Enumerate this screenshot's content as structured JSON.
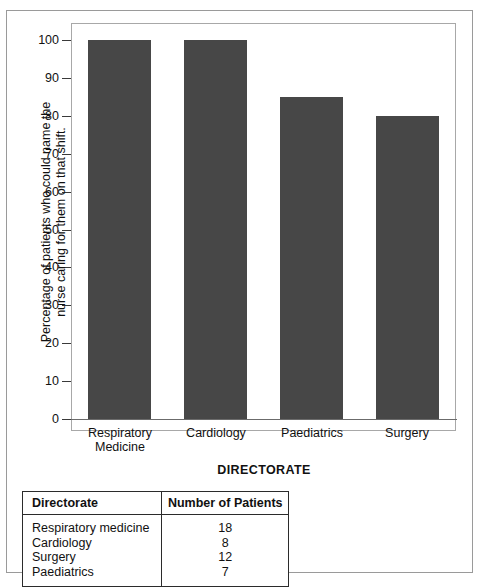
{
  "chart_data": {
    "type": "bar",
    "title": "",
    "categories": [
      "Respiratory Medicine",
      "Cardiology",
      "Paediatrics",
      "Surgery"
    ],
    "values": [
      100,
      100,
      85,
      80
    ],
    "xlabel": "DIRECTORATE",
    "ylabel": "Percentage of patients who could name the nurse caring for them on that shift.",
    "ylabel_line1": "Percentage of patients who could name the",
    "ylabel_line2": "nurse caring for them on that shift.",
    "ylim": [
      0,
      100
    ],
    "yticks": [
      100,
      90,
      80,
      70,
      60,
      50,
      40,
      30,
      20,
      10,
      0
    ],
    "ytick_labels": [
      "100",
      "90",
      "80",
      "70",
      "60",
      "50",
      "40",
      "30",
      "20",
      "10",
      "0"
    ],
    "grid": false,
    "legend": "none",
    "bar_color": "#474747",
    "frame_color": "#a8a8a8",
    "category_lines": [
      [
        "Respiratory",
        "Medicine"
      ],
      [
        "Cardiology",
        ""
      ],
      [
        "Paediatrics",
        ""
      ],
      [
        "Surgery",
        ""
      ]
    ]
  },
  "table": {
    "headers": [
      "Directorate",
      "Number of Patients"
    ],
    "rows": [
      {
        "directorate": "Respiratory medicine",
        "patients": "18"
      },
      {
        "directorate": "Cardiology",
        "patients": "8"
      },
      {
        "directorate": "Surgery",
        "patients": "12"
      },
      {
        "directorate": "Paediatrics",
        "patients": "7"
      }
    ]
  }
}
